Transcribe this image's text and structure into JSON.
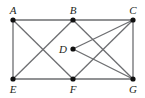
{
  "diagram": {
    "type": "graph",
    "nodes": [
      {
        "id": "A",
        "label": "A",
        "x": 13,
        "y": 20,
        "label_pos": "above"
      },
      {
        "id": "B",
        "label": "B",
        "x": 73,
        "y": 20,
        "label_pos": "above"
      },
      {
        "id": "C",
        "label": "C",
        "x": 133,
        "y": 20,
        "label_pos": "above"
      },
      {
        "id": "D",
        "label": "D",
        "x": 73,
        "y": 49,
        "label_pos": "left"
      },
      {
        "id": "E",
        "label": "E",
        "x": 13,
        "y": 79,
        "label_pos": "below"
      },
      {
        "id": "F",
        "label": "F",
        "x": 73,
        "y": 79,
        "label_pos": "below"
      },
      {
        "id": "G",
        "label": "G",
        "x": 133,
        "y": 79,
        "label_pos": "below"
      }
    ],
    "edges": [
      [
        "A",
        "B"
      ],
      [
        "B",
        "C"
      ],
      [
        "A",
        "E"
      ],
      [
        "C",
        "G"
      ],
      [
        "E",
        "F"
      ],
      [
        "F",
        "G"
      ],
      [
        "A",
        "F"
      ],
      [
        "B",
        "E"
      ],
      [
        "B",
        "G"
      ],
      [
        "C",
        "D"
      ],
      [
        "C",
        "F"
      ],
      [
        "D",
        "G"
      ]
    ],
    "colors": {
      "edge": "#6d6e71",
      "node": "#111111",
      "label": "#231f20"
    }
  }
}
